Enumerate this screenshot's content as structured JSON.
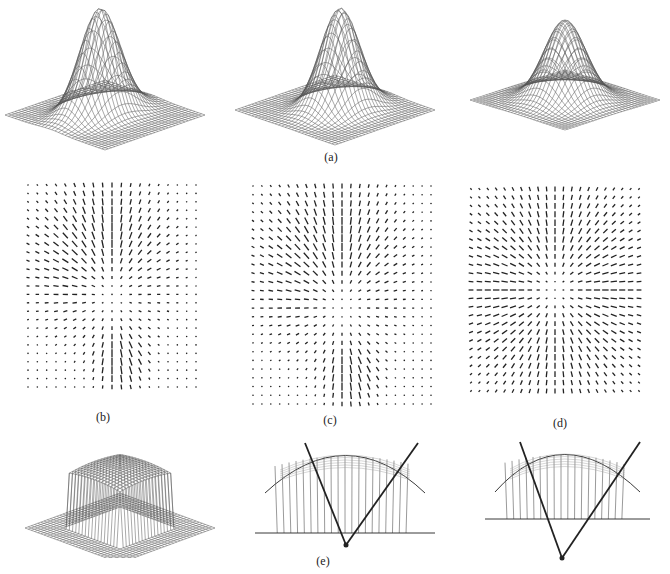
{
  "figure": {
    "labels": {
      "a": "(a)",
      "b": "(b)",
      "c": "(c)",
      "d": "(d)",
      "e": "(e)"
    },
    "rows": [
      {
        "name": "row-a",
        "content": "three wireframe 3D surface meshes of a peaked shape",
        "label": "(a)"
      },
      {
        "name": "row-bcd",
        "content": "three 2D vector (needle) fields on dot grids",
        "labels": [
          "(b)",
          "(c)",
          "(d)"
        ]
      },
      {
        "name": "row-e",
        "content": "one wireframe mesh plus two ray/projection diagrams with arcs",
        "label": "(e)"
      }
    ],
    "colors": {
      "ink": "#222222",
      "mesh": "#555555",
      "background": "#ffffff"
    }
  }
}
